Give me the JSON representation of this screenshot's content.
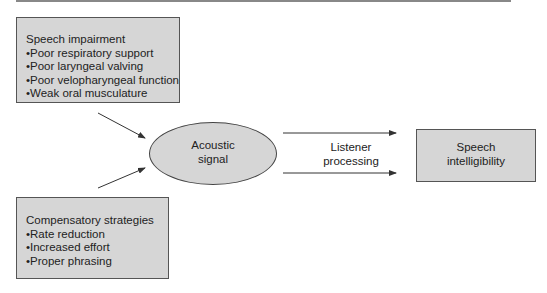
{
  "diagram": {
    "impairment": {
      "title": "Speech impairment",
      "items": [
        "•Poor respiratory support",
        "•Poor laryngeal valving",
        "•Poor velopharyngeal function",
        "•Weak oral musculature"
      ]
    },
    "compensatory": {
      "title": "Compensatory strategies",
      "items": [
        "•Rate reduction",
        "•Increased effort",
        "•Proper phrasing"
      ]
    },
    "acoustic": {
      "line1": "Acoustic",
      "line2": "signal"
    },
    "listener": {
      "line1": "Listener",
      "line2": "processing"
    },
    "intelligibility": {
      "line1": "Speech",
      "line2": "intelligibility"
    },
    "colors": {
      "box_fill": "#d6d6d6",
      "border": "#555555",
      "arrow": "#333333"
    }
  }
}
